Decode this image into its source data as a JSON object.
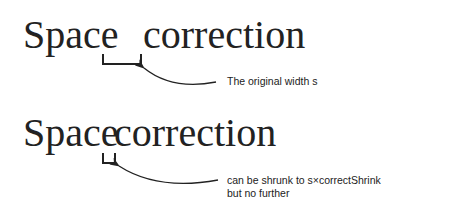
{
  "example1": {
    "word1": "Space",
    "word2": "correction",
    "annotation": "The original width s"
  },
  "example2": {
    "word1": "Space",
    "word2": "correction",
    "annotation_line1": "can be shrunk to s×correctShrink",
    "annotation_line2": "but no further"
  }
}
